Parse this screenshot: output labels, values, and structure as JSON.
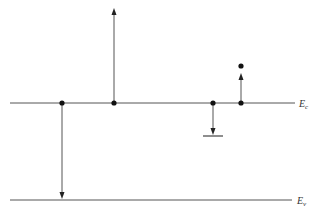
{
  "diagram": {
    "type": "energy-band-diagram",
    "colors": {
      "line": "#555555",
      "dot": "#111111",
      "background": "#ffffff"
    },
    "levels": [
      {
        "id": "conduction",
        "label": "E",
        "subscript": "c",
        "y": 103,
        "x1": 10,
        "x2": 295
      },
      {
        "id": "valence",
        "label": "E",
        "subscript": "v",
        "y": 200,
        "x1": 10,
        "x2": 292
      }
    ],
    "transitions": [
      {
        "id": "band-to-band-recombination",
        "x": 62,
        "from_y": 103,
        "to_y": 198,
        "direction": "down"
      },
      {
        "id": "excitation-up",
        "x": 114,
        "from_y": 103,
        "to_y": 8,
        "direction": "up"
      },
      {
        "id": "trap-capture",
        "x": 213,
        "from_y": 103,
        "to_y": 134,
        "direction": "down",
        "trap_bar": {
          "x1": 203,
          "x2": 223,
          "y": 136
        }
      },
      {
        "id": "trap-emission",
        "x": 241,
        "from_y": 103,
        "to_y": 73,
        "direction": "up",
        "end_dot_y": 66
      }
    ]
  }
}
